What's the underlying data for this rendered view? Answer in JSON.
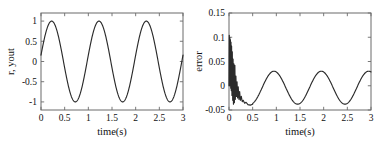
{
  "figure": {
    "background": "#ffffff",
    "line_color": "#2b2b2b",
    "grid_color": "#c9c9c9",
    "axis_color": "#6b6b6b"
  },
  "chart_data": [
    {
      "type": "line",
      "name": "reference-and-output",
      "title": "",
      "xlabel": "time(s)",
      "ylabel": "r, yout",
      "xlim": [
        0,
        3
      ],
      "ylim": [
        -1.2,
        1.2
      ],
      "xticks": [
        0,
        0.5,
        1,
        1.5,
        2,
        2.5,
        3
      ],
      "xticklabels": [
        "0",
        "0.5",
        "1",
        "1.5",
        "2",
        "2.5",
        "3"
      ],
      "yticks": [
        -1,
        -0.5,
        0,
        0.5,
        1
      ],
      "yticklabels": [
        "-1",
        "-0.5",
        "0",
        "0.5",
        "1"
      ],
      "grid": true,
      "legend": "none",
      "description": "Sinusoidal reference tracking, amplitude 1, period 1 s, starting near 0.15 at t=0",
      "series": [
        {
          "name": "yout",
          "x": [
            0,
            0.02,
            0.04,
            0.06,
            0.08,
            0.1,
            0.12,
            0.14,
            0.16,
            0.18,
            0.2,
            0.22,
            0.24,
            0.26,
            0.28,
            0.3,
            0.32,
            0.34,
            0.36,
            0.38,
            0.4,
            0.42,
            0.44,
            0.46,
            0.48,
            0.5,
            0.52,
            0.54,
            0.56,
            0.58,
            0.6,
            0.62,
            0.64,
            0.66,
            0.68,
            0.7,
            0.72,
            0.74,
            0.76,
            0.78,
            0.8,
            0.82,
            0.84,
            0.86,
            0.88,
            0.9,
            0.92,
            0.94,
            0.96,
            0.98,
            1.0,
            1.02,
            1.04,
            1.06,
            1.08,
            1.1,
            1.12,
            1.14,
            1.16,
            1.18,
            1.2,
            1.22,
            1.24,
            1.26,
            1.28,
            1.3,
            1.32,
            1.34,
            1.36,
            1.38,
            1.4,
            1.42,
            1.44,
            1.46,
            1.48,
            1.5,
            1.52,
            1.54,
            1.56,
            1.58,
            1.6,
            1.62,
            1.64,
            1.66,
            1.68,
            1.7,
            1.72,
            1.74,
            1.76,
            1.78,
            1.8,
            1.82,
            1.84,
            1.86,
            1.88,
            1.9,
            1.92,
            1.94,
            1.96,
            1.98,
            2.0,
            2.02,
            2.04,
            2.06,
            2.08,
            2.1,
            2.12,
            2.14,
            2.16,
            2.18,
            2.2,
            2.22,
            2.24,
            2.26,
            2.28,
            2.3,
            2.32,
            2.34,
            2.36,
            2.38,
            2.4,
            2.42,
            2.44,
            2.46,
            2.48,
            2.5,
            2.52,
            2.54,
            2.56,
            2.58,
            2.6,
            2.62,
            2.64,
            2.66,
            2.68,
            2.7,
            2.72,
            2.74,
            2.76,
            2.78,
            2.8,
            2.82,
            2.84,
            2.86,
            2.88,
            2.9,
            2.92,
            2.94,
            2.96,
            2.98,
            3.0
          ],
          "amplitude": 1.0,
          "period": 1.0,
          "phase_deg": 9
        }
      ]
    },
    {
      "type": "line",
      "name": "tracking-error",
      "title": "",
      "xlabel": "time(s)",
      "ylabel": "error",
      "xlim": [
        0,
        3
      ],
      "ylim": [
        -0.05,
        0.15
      ],
      "xticks": [
        0,
        0.5,
        1,
        1.5,
        2,
        2.5,
        3
      ],
      "xticklabels": [
        "0",
        "0.5",
        "1",
        "1.5",
        "2",
        "2.5",
        "3"
      ],
      "yticks": [
        -0.05,
        0,
        0.05,
        0.1,
        0.15
      ],
      "yticklabels": [
        "-0.05",
        "0",
        "0.05",
        "0.1",
        "0.15"
      ],
      "grid": true,
      "legend": "none",
      "description": "Tracking error: initial spike to about 0.105 with fast decaying chatter over first 0.5 s, then steady sinusoidal ripple between -0.038 and +0.030 with period 1 s",
      "transient": {
        "peak": 0.105,
        "settle_time": 0.5,
        "chatter_points": [
          [
            0.0,
            0.0
          ],
          [
            0.006,
            0.104
          ],
          [
            0.012,
            0.0
          ],
          [
            0.018,
            0.1
          ],
          [
            0.024,
            0.0
          ],
          [
            0.03,
            0.095
          ],
          [
            0.036,
            -0.005
          ],
          [
            0.042,
            0.09
          ],
          [
            0.048,
            -0.01
          ],
          [
            0.055,
            0.082
          ],
          [
            0.062,
            -0.02
          ],
          [
            0.07,
            0.07
          ],
          [
            0.078,
            -0.03
          ],
          [
            0.086,
            0.055
          ],
          [
            0.094,
            -0.038
          ],
          [
            0.104,
            0.045
          ],
          [
            0.114,
            -0.035
          ],
          [
            0.124,
            0.042
          ],
          [
            0.134,
            -0.028
          ],
          [
            0.146,
            0.02
          ],
          [
            0.158,
            -0.022
          ],
          [
            0.17,
            0.008
          ],
          [
            0.182,
            -0.025
          ],
          [
            0.195,
            -0.002
          ],
          [
            0.21,
            -0.028
          ],
          [
            0.225,
            -0.012
          ],
          [
            0.24,
            -0.03
          ],
          [
            0.26,
            -0.022
          ],
          [
            0.28,
            -0.033
          ],
          [
            0.3,
            -0.03
          ],
          [
            0.33,
            -0.036
          ],
          [
            0.36,
            -0.034
          ],
          [
            0.4,
            -0.039
          ],
          [
            0.45,
            -0.04
          ],
          [
            0.5,
            -0.038
          ]
        ]
      },
      "steady_state": {
        "max": 0.03,
        "min": -0.038,
        "period": 1.0,
        "offset": -0.004
      }
    }
  ]
}
